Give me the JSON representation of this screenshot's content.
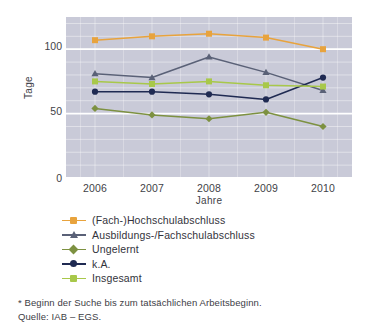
{
  "chart_data": {
    "type": "line",
    "title": "",
    "xlabel": "Jahre",
    "ylabel": "Tage",
    "categories": [
      "2006",
      "2007",
      "2008",
      "2009",
      "2010"
    ],
    "x": [
      2006,
      2007,
      2008,
      2009,
      2010
    ],
    "ylim": [
      0,
      125
    ],
    "yticks": [
      0,
      50,
      100
    ],
    "ytick_labels": [
      "0",
      "50",
      "100"
    ],
    "grid": true,
    "grid_minor": true,
    "legend_position": "below",
    "series": [
      {
        "name": "(Fach-)Hochschulabschluss",
        "color": "#e8a33d",
        "marker": "square",
        "values": [
          107,
          110,
          112,
          109,
          100
        ]
      },
      {
        "name": "Ausbildungs-/Fachschulabschluss",
        "color": "#5a6177",
        "marker": "triangle",
        "values": [
          81,
          78,
          94,
          82,
          68
        ]
      },
      {
        "name": "Ungelernt",
        "color": "#7d9141",
        "marker": "diamond",
        "values": [
          54,
          49,
          46,
          51,
          40
        ]
      },
      {
        "name": "k.A.",
        "color": "#1f2a52",
        "marker": "circle",
        "values": [
          67,
          67,
          65,
          61,
          78
        ]
      },
      {
        "name": "Insgesamt",
        "color": "#a8c84a",
        "marker": "square",
        "values": [
          75,
          73,
          75,
          72,
          71
        ]
      }
    ]
  },
  "axes": {
    "y_title": "Tage",
    "x_title": "Jahre",
    "y_tick_labels": [
      "100",
      "50",
      "0"
    ],
    "x_tick_labels": [
      "2006",
      "2007",
      "2008",
      "2009",
      "2010"
    ]
  },
  "legend": {
    "items": [
      {
        "label": "(Fach-)Hochschulabschluss",
        "color": "#e8a33d",
        "marker": "square"
      },
      {
        "label": "Ausbildungs-/Fachschulabschluss",
        "color": "#5a6177",
        "marker": "triangle"
      },
      {
        "label": "Ungelernt",
        "color": "#7d9141",
        "marker": "diamond"
      },
      {
        "label": "k.A.",
        "color": "#1f2a52",
        "marker": "circle"
      },
      {
        "label": "Insgesamt",
        "color": "#a8c84a",
        "marker": "square"
      }
    ]
  },
  "notes": {
    "footnote": "* Beginn der Suche bis zum tatsächlichen Arbeitsbeginn.",
    "source": "Quelle: IAB – EGS."
  },
  "style": {
    "panel_background": "#c9cad8",
    "gridline_color": "#ffffff",
    "page_background": "#ffffff"
  }
}
